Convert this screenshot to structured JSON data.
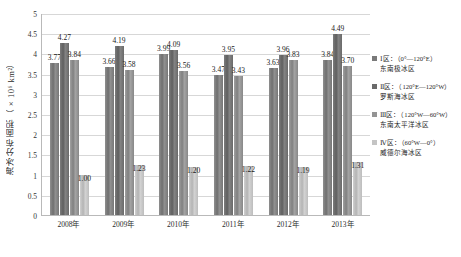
{
  "chart_data": {
    "type": "bar",
    "title": "",
    "xlabel": "",
    "ylabel": "海冰分布面积（×10⁶ km²）",
    "ylim": [
      0,
      5
    ],
    "ytick_step": 0.5,
    "grid": true,
    "legend_position": "right",
    "categories": [
      "2008年",
      "2009年",
      "2010年",
      "2011年",
      "2012年",
      "2013年"
    ],
    "ytick_labels": [
      "5",
      "4.5",
      "4",
      "3.5",
      "3",
      "2.5",
      "2",
      "1.5",
      "1",
      "0.5",
      "0"
    ],
    "series": [
      {
        "name": "Ⅰ区：（0°—120°E）东南极冰区",
        "legend_line1": "Ⅰ区：（0°—120°E）",
        "legend_line2": "东南极冰区",
        "color": "#7a7a7a",
        "values": [
          3.77,
          3.66,
          3.99,
          3.47,
          3.63,
          3.84
        ],
        "labels": [
          "3.77",
          "3.66",
          "3.99",
          "3.47",
          "3.63",
          "3.84"
        ]
      },
      {
        "name": "Ⅱ区：（120°E—120°W）罗斯海冰区",
        "legend_line1": "Ⅱ区：（120°E—120°W）",
        "legend_line2": "罗斯海冰区",
        "color": "#6a6a6a",
        "values": [
          4.27,
          4.19,
          4.09,
          3.95,
          3.96,
          4.49
        ],
        "labels": [
          "4.27",
          "4.19",
          "4.09",
          "3.95",
          "3.96",
          "4.49"
        ]
      },
      {
        "name": "Ⅲ区：（120°W—60°W）东南太平洋冰区",
        "legend_line1": "Ⅲ区：（120°W—60°W）",
        "legend_line2": "东南太平洋冰区",
        "color": "#949494",
        "values": [
          3.84,
          3.58,
          3.56,
          3.43,
          3.83,
          3.7
        ],
        "labels": [
          "3.84",
          "3.58",
          "3.56",
          "3.43",
          "3.83",
          "3.70"
        ]
      },
      {
        "name": "Ⅳ区：（60°W—0°）威德尔海冰区",
        "legend_line1": "Ⅳ区：（60°W—0°）",
        "legend_line2": "威德尔海冰区",
        "color": "#c4c4c4",
        "values": [
          1.0,
          1.23,
          1.2,
          1.22,
          1.19,
          1.31
        ],
        "labels": [
          "1.00",
          "1.23",
          "1.20",
          "1.22",
          "1.19",
          "1.31"
        ]
      }
    ]
  }
}
